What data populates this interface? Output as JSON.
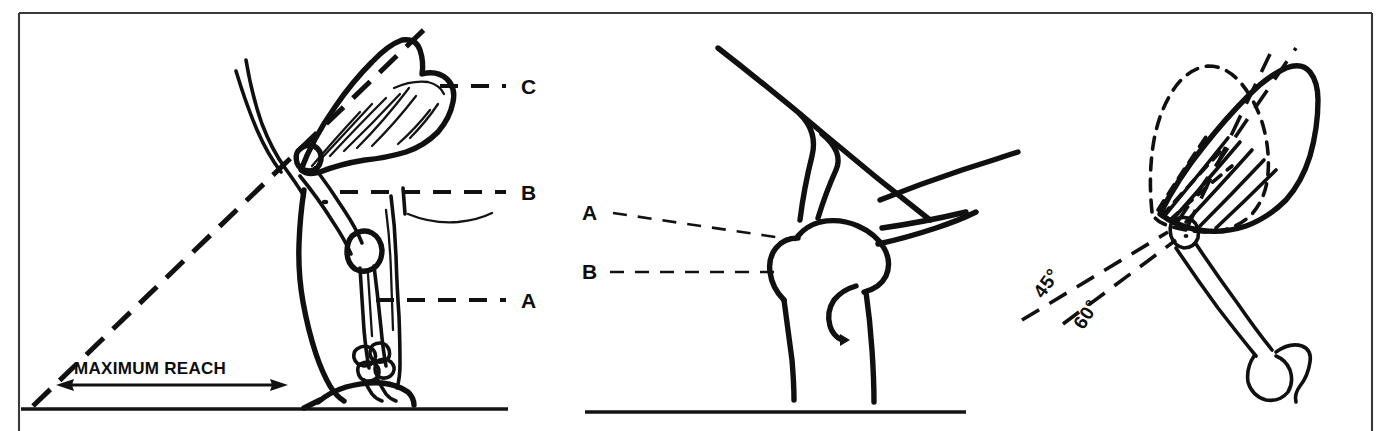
{
  "figure": {
    "background_color": "#ffffff",
    "ink_color": "#121212",
    "frame_color": "#3a3a3a",
    "panel_count": 3
  },
  "panels": [
    {
      "id": "panel-left",
      "name": "maximum-reach-panel",
      "description": "Side view of extended forelimb with skeletal overlay, maximum reach dimension and reach angle line",
      "labels": [
        {
          "key": "C",
          "text": "C",
          "x": 521,
          "y": 78,
          "role": "callout-letter",
          "leader": "dashed-horizontal"
        },
        {
          "key": "B",
          "text": "B",
          "x": 521,
          "y": 183,
          "role": "callout-letter",
          "leader": "dashed-horizontal"
        },
        {
          "key": "A",
          "text": "A",
          "x": 521,
          "y": 290,
          "role": "callout-letter",
          "leader": "dashed-horizontal"
        }
      ],
      "dimension": {
        "text": "MAXIMUM REACH",
        "x": 74,
        "y": 361,
        "arrow": "double-headed",
        "arrow_y": 385,
        "arrow_x1": 58,
        "arrow_x2": 285
      }
    },
    {
      "id": "panel-middle",
      "name": "joint-detail-panel",
      "description": "Enlarged detail of the joint showing tendon and bone landmarks",
      "labels": [
        {
          "key": "A",
          "text": "A",
          "x": 582,
          "y": 203,
          "role": "callout-letter",
          "leader": "dashed-diagonal"
        },
        {
          "key": "B",
          "text": "B",
          "x": 582,
          "y": 262,
          "role": "callout-letter",
          "leader": "dashed-horizontal"
        }
      ]
    },
    {
      "id": "panel-right",
      "name": "angle-comparison-panel",
      "description": "Limb shown with two reach axes compared, solid and dashed limb outlines",
      "labels": [
        {
          "key": "45",
          "text": "45°",
          "x": 1035,
          "y": 262,
          "role": "angle-label",
          "rotation": -55
        },
        {
          "key": "60",
          "text": "60°",
          "x": 1073,
          "y": 292,
          "role": "angle-label",
          "rotation": -58
        }
      ]
    }
  ],
  "callout_legend": {
    "A": "A",
    "B": "B",
    "C": "C"
  },
  "angles": {
    "shallow": "45°",
    "steep": "60°"
  },
  "dimension_caption": "MAXIMUM REACH",
  "icons": {
    "arrow_left": "arrow-left-icon",
    "arrow_right": "arrow-right-icon",
    "dashed_leader": "dashed-leader-icon"
  }
}
